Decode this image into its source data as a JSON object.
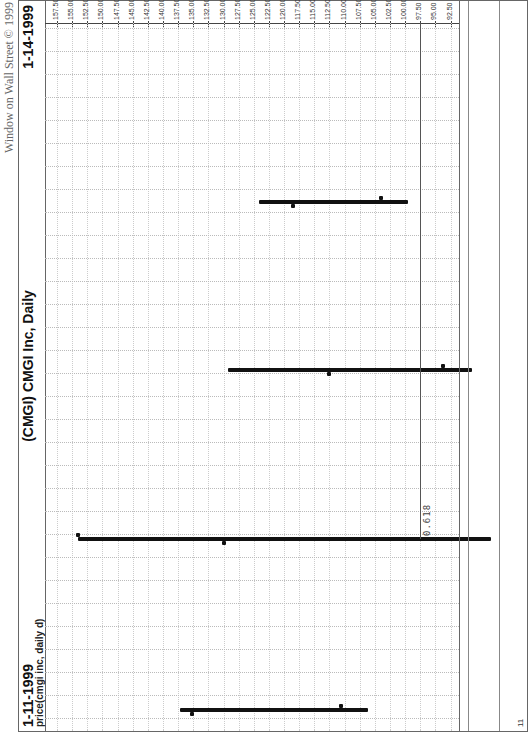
{
  "header": {
    "credit": "Window on Wall Street © 1999",
    "title": "(CMGI)  CMGI Inc, Daily",
    "date_start": "1-11-1999",
    "date_end": "1-14-1999",
    "study_label": "price(cmgi inc, daily d)"
  },
  "fib": {
    "label": "0.618",
    "price": 97.5
  },
  "bottom_marker": "11",
  "chart_data": {
    "type": "ohlc",
    "title": "(CMGI) CMGI Inc, Daily",
    "xlabel": "",
    "ylabel": "price(cmgi inc, daily d)",
    "categories": [
      "1-11-1999",
      "1-12-1999",
      "1-13-1999",
      "1-14-1999"
    ],
    "series": [
      {
        "name": "open",
        "values": [
          135.2,
          130.0,
          112.5,
          118.6
        ]
      },
      {
        "name": "high",
        "values": [
          137.2,
          154.0,
          129.3,
          124.2
        ]
      },
      {
        "name": "low",
        "values": [
          106.2,
          85.9,
          88.9,
          99.6
        ]
      },
      {
        "name": "close",
        "values": [
          110.6,
          154.0,
          93.8,
          104.0
        ]
      }
    ],
    "ylim": [
      85.0,
      157.5
    ],
    "yticks": [
      "157.50",
      "155.00",
      "152.50",
      "150.00",
      "147.50",
      "145.00",
      "142.50",
      "140.00",
      "137.50",
      "135.00",
      "132.50",
      "130.00",
      "127.50",
      "125.00",
      "122.50",
      "120.00",
      "117.50",
      "115.00",
      "112.50",
      "110.00",
      "107.50",
      "105.00",
      "102.50",
      "100.00",
      "97.50",
      "95.00",
      "92.50",
      "90.00",
      "87.50",
      "85.00"
    ],
    "annotations": [
      {
        "type": "hline",
        "y": 97.5,
        "label": "0.618"
      }
    ],
    "grid": true,
    "axis_position": "right"
  }
}
